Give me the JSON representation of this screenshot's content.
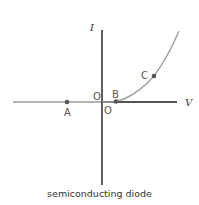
{
  "diagram": {
    "title": "semiconducting diode",
    "axes": {
      "x_label": "V",
      "y_label": "I",
      "origin_label_x": "O",
      "origin_label_y": "O"
    },
    "points": [
      {
        "label": "A",
        "position": "negative V, I = 0"
      },
      {
        "label": "B",
        "position": "small positive V, I ≈ 0"
      },
      {
        "label": "C",
        "position": "positive V, rising I"
      }
    ],
    "curve": "I = 0 for V < 0, exponential rise for V > 0",
    "colors": {
      "axis_dark": "#1a1a1a",
      "curve": "#a0a0a0",
      "negative_axis": "#9a9a9a",
      "point": "#555555"
    }
  }
}
